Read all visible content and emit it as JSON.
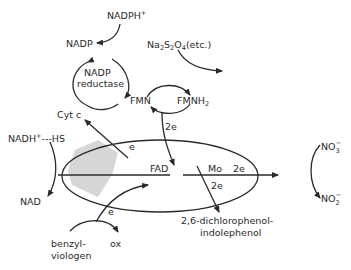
{
  "diagram": {
    "type": "enzyme electron-transfer scheme (nitrate reductase)",
    "labels": {
      "nadph": "NADPH",
      "nadph_sup": "+",
      "nadp": "NADP",
      "nadp_reductase_line1": "NADP",
      "nadp_reductase_line2": "reductase",
      "dithionite_main": "Na",
      "dithionite_s": "S",
      "dithionite_o": "O",
      "dithionite_sub2a": "2",
      "dithionite_sub2b": "2",
      "dithionite_sub4": "4",
      "dithionite_etc": "(etc.)",
      "fmn": "FMN",
      "fmnh2": "FMNH",
      "fmnh2_sub": "2",
      "cyt_c": "Cyt c",
      "nadh": "NADH",
      "nadh_sup": "+",
      "hs": "---HS",
      "nad": "NAD",
      "fad": "FAD",
      "mo": "Mo",
      "mo_2e": "2e",
      "fmn_2e": "2e",
      "dcpip_2e": "2e",
      "cyt_e": "e",
      "bv_e": "e",
      "dcpip_line1": "2,6-dichlorophenol-",
      "dcpip_line2": "indolephenol",
      "benzyl_line1": "benzyl-",
      "benzyl_line2": "viologen",
      "ox": "ox",
      "no3": "NO",
      "no3_sub": "3",
      "no3_sup": "−",
      "no2": "NO",
      "no2_sub": "2",
      "no2_sup": "−"
    },
    "colors": {
      "ink": "#2a2a2a",
      "shaded_region": "#d6d6d6",
      "background": "#ffffff"
    }
  }
}
